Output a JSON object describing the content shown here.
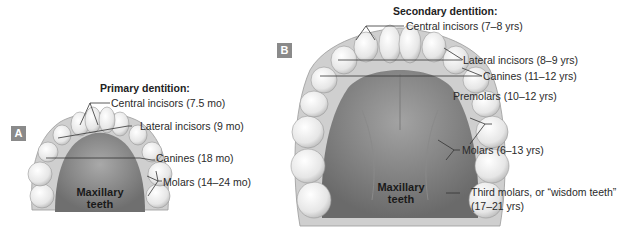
{
  "panel_a": {
    "badge": "A",
    "heading": "Primary dentition:",
    "jaw_label_line1": "Maxillary",
    "jaw_label_line2": "teeth",
    "labels": [
      {
        "text": "Central incisors (7.5 mo)"
      },
      {
        "text": "Lateral incisors (9 mo)"
      },
      {
        "text": "Canines (18 mo)"
      },
      {
        "text": "Molars (14–24 mo)"
      }
    ]
  },
  "panel_b": {
    "badge": "B",
    "heading": "Secondary dentition:",
    "jaw_label_line1": "Maxillary",
    "jaw_label_line2": "teeth",
    "labels": [
      {
        "text": "Central incisors (7–8 yrs)"
      },
      {
        "text": "Lateral incisors (8–9 yrs)"
      },
      {
        "text": "Canines (11–12 yrs)"
      },
      {
        "text": "Premolars (10–12 yrs)"
      },
      {
        "text": "Molars (6–13 yrs)"
      },
      {
        "text": "Third molars, or “wisdom teeth”"
      },
      {
        "text": "(17–21 yrs)"
      }
    ]
  },
  "colors": {
    "badge": "#8a8a8a",
    "palate": "#8e8e8e",
    "tooth": "#ececec",
    "leader": "#333333"
  }
}
